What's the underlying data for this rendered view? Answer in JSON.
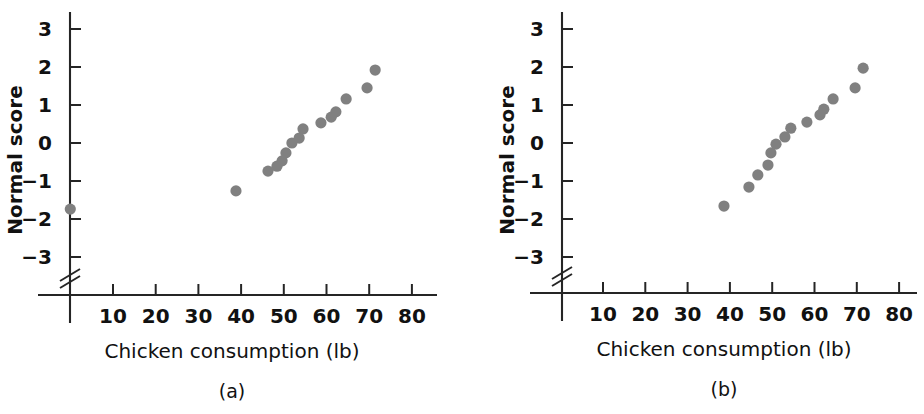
{
  "figure": {
    "background_color": "#ffffff",
    "point_color": "#808080",
    "axis_color": "#252525"
  },
  "panels": [
    {
      "id": "a",
      "caption": "(a)",
      "x_axis_title": "Chicken consumption (lb)",
      "y_axis_title": "Normal score",
      "x_ticks": [
        "10",
        "20",
        "30",
        "40",
        "50",
        "60",
        "70",
        "80"
      ],
      "y_ticks": [
        "3",
        "2",
        "1",
        "0",
        "−1",
        "−2",
        "−3"
      ],
      "axis_break": true
    },
    {
      "id": "b",
      "caption": "(b)",
      "x_axis_title": "Chicken consumption (lb)",
      "y_axis_title": "Normal score",
      "x_ticks": [
        "10",
        "20",
        "30",
        "40",
        "50",
        "60",
        "70",
        "80"
      ],
      "y_ticks": [
        "3",
        "2",
        "1",
        "0",
        "−1",
        "−2",
        "−3"
      ],
      "axis_break": true
    }
  ],
  "chart_data": [
    {
      "type": "scatter",
      "panel": "a",
      "title": "(a)",
      "xlabel": "Chicken consumption (lb)",
      "ylabel": "Normal score",
      "xlim": [
        0,
        85
      ],
      "ylim": [
        -3.5,
        3.5
      ],
      "xticks": [
        10,
        20,
        30,
        40,
        50,
        60,
        70,
        80
      ],
      "yticks": [
        3,
        2,
        1,
        0,
        -1,
        -2,
        -3
      ],
      "grid": false,
      "legend": false,
      "axis_break_y": true,
      "x": [
        0.0,
        38.8,
        46.3,
        48.4,
        49.6,
        50.5,
        51.9,
        53.6,
        54.5,
        58.7,
        61.1,
        62.2,
        64.6,
        69.5,
        71.4
      ],
      "y": [
        -1.74,
        -1.26,
        -0.74,
        -0.61,
        -0.47,
        -0.26,
        0.0,
        0.13,
        0.37,
        0.53,
        0.68,
        0.82,
        1.16,
        1.45,
        1.92
      ]
    },
    {
      "type": "scatter",
      "panel": "b",
      "title": "(b)",
      "xlabel": "Chicken consumption (lb)",
      "ylabel": "Normal score",
      "xlim": [
        0,
        85
      ],
      "ylim": [
        -3.5,
        3.5
      ],
      "xticks": [
        10,
        20,
        30,
        40,
        50,
        60,
        70,
        80
      ],
      "yticks": [
        3,
        2,
        1,
        0,
        -1,
        -2,
        -3
      ],
      "grid": false,
      "legend": false,
      "axis_break_y": true,
      "x": [
        38.6,
        44.5,
        46.6,
        49.0,
        49.7,
        50.9,
        53.0,
        54.4,
        58.2,
        61.3,
        62.2,
        64.4,
        69.6,
        71.5
      ],
      "y": [
        -1.66,
        -1.16,
        -0.84,
        -0.58,
        -0.26,
        -0.03,
        0.16,
        0.39,
        0.55,
        0.74,
        0.89,
        1.16,
        1.45,
        1.97
      ]
    }
  ]
}
